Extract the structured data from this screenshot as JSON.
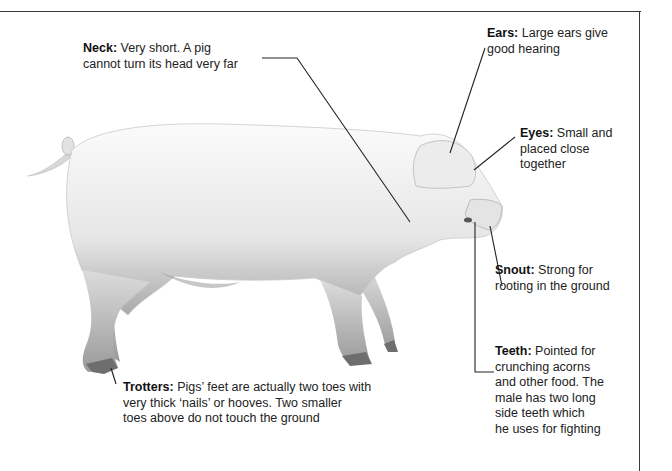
{
  "diagram": {
    "labels": [
      {
        "id": "neck",
        "term": "Neck:",
        "text": " Very short. A pig cannot turn its head very far",
        "lines": [
          "Very short. A pig",
          "cannot turn its head very far"
        ]
      },
      {
        "id": "ears",
        "term": "Ears:",
        "lines": [
          "Large ears give",
          "good hearing"
        ]
      },
      {
        "id": "eyes",
        "term": "Eyes:",
        "lines": [
          "Small and",
          "placed close",
          "together"
        ]
      },
      {
        "id": "snout",
        "term": "Snout:",
        "lines": [
          "Strong for",
          "rooting in the ground"
        ]
      },
      {
        "id": "teeth",
        "term": "Teeth:",
        "lines": [
          "Pointed for",
          "crunching acorns",
          "and other food. The",
          "male has two long",
          "side teeth which",
          "he uses for fighting"
        ]
      },
      {
        "id": "trotters",
        "term": "Trotters:",
        "lines": [
          "Pigs’ feet are actually two toes with",
          "very thick ‘nails’ or hooves. Two smaller",
          "toes above do not touch the ground"
        ]
      }
    ],
    "colors": {
      "line": "#222222",
      "pig_light": "#f4f4f4",
      "pig_shade": "#bdbdbd",
      "frame": "#3a3a3a"
    }
  }
}
